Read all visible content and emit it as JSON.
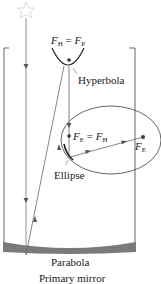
{
  "diagram": {
    "type": "telescope-optics",
    "labels": {
      "hyperbola_focus": {
        "left_var": "F",
        "left_sub": "H",
        "eq": "=",
        "right_var": "F",
        "right_sub": "P"
      },
      "hyperbola": "Hyperbola",
      "ellipse_focus": {
        "left_var": "F",
        "left_sub": "E",
        "eq": "=",
        "right_var": "F",
        "right_sub": "H"
      },
      "ellipse_far_focus": {
        "var": "F",
        "sub": "E"
      },
      "ellipse": "Ellipse",
      "parabola": "Parabola",
      "caption": "Primary mirror"
    },
    "icons": {
      "star": "star-outline-icon"
    },
    "colors": {
      "line": "#555555",
      "mirror_fill": "#777777",
      "star": "#dddddd",
      "text": "#1a1a1a"
    }
  }
}
